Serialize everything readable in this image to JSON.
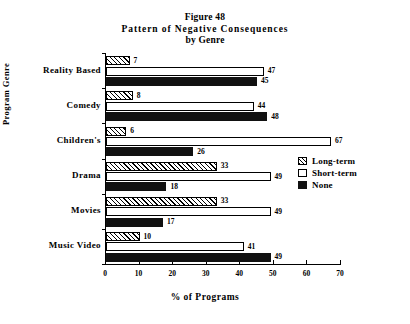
{
  "chart_data": {
    "type": "bar",
    "orientation": "horizontal",
    "title": "Figure 48\nPattern of Negative Consequences\nby Genre",
    "title_lines": [
      "Figure 48",
      "Pattern of Negative Consequences",
      "by Genre"
    ],
    "xlabel": "% of Programs",
    "ylabel": "Program Genre",
    "xlim": [
      0,
      70
    ],
    "xticks": [
      0,
      10,
      20,
      30,
      40,
      50,
      60,
      70
    ],
    "xtick_labels": [
      "0",
      "10",
      "20",
      "30",
      "40",
      "50",
      "60",
      "70"
    ],
    "grid": false,
    "legend_position": "right-middle",
    "categories": [
      "Reality Based",
      "Comedy",
      "Children's",
      "Drama",
      "Movies",
      "Music Video"
    ],
    "series": [
      {
        "name": "Long-term",
        "fill": "hatched-diagonal",
        "values": [
          7,
          8,
          6,
          33,
          33,
          10
        ],
        "labels": [
          "7",
          "8",
          "6",
          "33",
          "33",
          "10"
        ]
      },
      {
        "name": "Short-term",
        "fill": "white",
        "values": [
          47,
          44,
          67,
          49,
          49,
          41
        ],
        "labels": [
          "47",
          "44",
          "67",
          "49",
          "49",
          "41"
        ]
      },
      {
        "name": "None",
        "fill": "black",
        "values": [
          45,
          48,
          26,
          18,
          17,
          49
        ],
        "labels": [
          "45",
          "48",
          "26",
          "18",
          "17",
          "49"
        ]
      }
    ]
  },
  "colors": {
    "axis": "#000000",
    "text": "#000000",
    "bar_none": "#111111",
    "bar_short": "#ffffff",
    "background": "#ffffff"
  }
}
